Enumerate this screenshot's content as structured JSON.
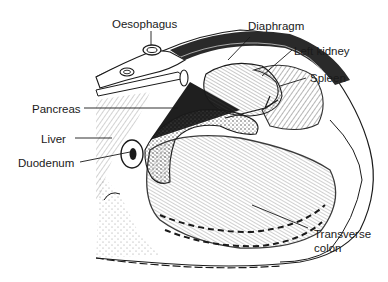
{
  "figure": {
    "type": "anatomical-line-drawing",
    "labels": {
      "oesophagus": "Oesophagus",
      "diaphragm": "Diaphragm",
      "left_kidney": "Left kidney",
      "spleen": "Spleen",
      "pancreas": "Pancreas",
      "liver": "Liver",
      "duodenum": "Duodenum",
      "transverse_colon_1": "Transverse",
      "transverse_colon_2": "colon"
    }
  },
  "colors": {
    "ink": "#1a1a1a",
    "background": "#ffffff"
  }
}
